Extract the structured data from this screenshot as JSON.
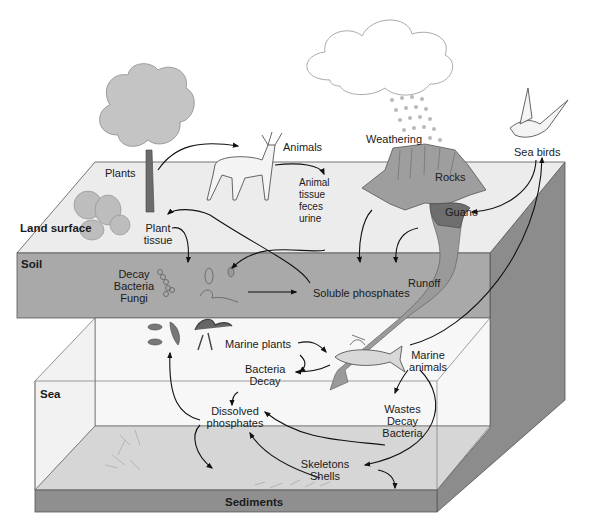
{
  "diagram": {
    "colors": {
      "background": "#ffffff",
      "land_surface": "#ececec",
      "soil": "#a9a9a9",
      "side_face": "#8c8c8c",
      "sea_water": "#f4f4f4",
      "sea_floor": "#d8d8d8",
      "sediments": "#8f8f8f",
      "rocks": "#9e9e9e",
      "guano": "#6e6e6e",
      "runoff": "#9a9a9a",
      "arrow": "#111111"
    },
    "zones": {
      "land_surface": "Land surface",
      "soil": "Soil",
      "sea": "Sea",
      "sediments": "Sediments"
    },
    "labels": {
      "plants": "Plants",
      "animals": "Animals",
      "plant_tissue": [
        "Plant",
        "tissue"
      ],
      "animal_waste": [
        "Animal",
        "tissue",
        "feces",
        "urine"
      ],
      "weathering": "Weathering",
      "rocks": "Rocks",
      "guano": "Guano",
      "sea_birds": "Sea birds",
      "decomposers": [
        "Decay",
        "Bacteria",
        "Fungi"
      ],
      "soluble_phosphates": "Soluble phosphates",
      "runoff": "Runoff",
      "marine_plants": "Marine plants",
      "bacteria_decay": [
        "Bacteria",
        "Decay"
      ],
      "marine_animals": [
        "Marine",
        "animals"
      ],
      "dissolved_phosphates": [
        "Dissolved",
        "phosphates"
      ],
      "wastes_decay_bacteria": [
        "Wastes",
        "Decay",
        "Bacteria"
      ],
      "skeletons_shells": [
        "Skeletons",
        "Shells"
      ]
    },
    "illustrations": [
      "cloud-icon",
      "rain-icon",
      "tree-icon",
      "shrubs-icon",
      "deer-icon",
      "rocks-icon",
      "guano-icon",
      "seabird-icon",
      "bacteria-icon",
      "fungi-icon",
      "fish-icon",
      "squid-icon",
      "shells-icon"
    ],
    "flows": [
      {
        "from": "Plants",
        "to": "Animals"
      },
      {
        "from": "Animals",
        "to": "Animal tissue feces urine"
      },
      {
        "from": "Animal tissue feces urine",
        "to": "Decay Bacteria Fungi"
      },
      {
        "from": "Plant tissue",
        "to": "Decay Bacteria Fungi"
      },
      {
        "from": "Decay Bacteria Fungi",
        "to": "Soluble phosphates"
      },
      {
        "from": "Soluble phosphates",
        "to": "Plants"
      },
      {
        "from": "Rocks",
        "to": "Soluble phosphates"
      },
      {
        "from": "Guano",
        "to": "Soluble phosphates"
      },
      {
        "from": "Sea birds",
        "to": "Guano"
      },
      {
        "from": "Marine animals",
        "to": "Sea birds"
      },
      {
        "from": "Runoff",
        "to": "Sea"
      },
      {
        "from": "Marine plants",
        "to": "Marine animals"
      },
      {
        "from": "Marine plants",
        "to": "Bacteria Decay"
      },
      {
        "from": "Marine animals",
        "to": "Bacteria Decay"
      },
      {
        "from": "Bacteria Decay",
        "to": "Dissolved phosphates"
      },
      {
        "from": "Dissolved phosphates",
        "to": "Marine plants"
      },
      {
        "from": "Marine animals",
        "to": "Wastes Decay Bacteria"
      },
      {
        "from": "Marine animals",
        "to": "Skeletons Shells"
      },
      {
        "from": "Wastes Decay Bacteria",
        "to": "Dissolved phosphates"
      },
      {
        "from": "Skeletons Shells",
        "to": "Dissolved phosphates"
      },
      {
        "from": "Dissolved phosphates",
        "to": "Sediments"
      },
      {
        "from": "Skeletons Shells",
        "to": "Sediments"
      }
    ]
  }
}
